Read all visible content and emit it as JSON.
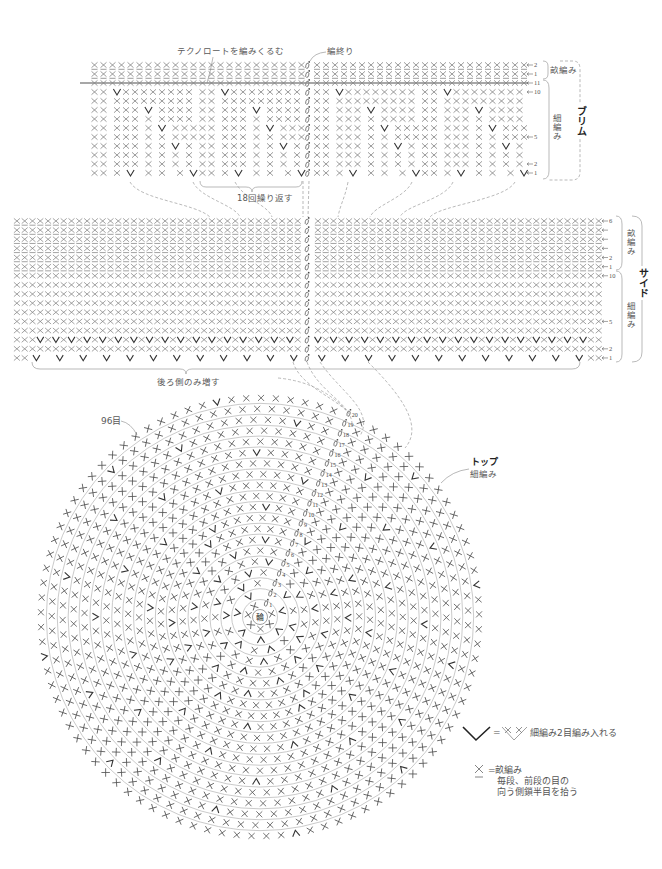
{
  "annotations": {
    "wrap_technoroto": "テクノロートを編みくるむ",
    "finish": "編終り",
    "repeat": "18回繰り返す",
    "increase_back_only": "後ろ側のみ増す",
    "stitch_count": "96目"
  },
  "brim": {
    "title": "ブリム",
    "back_loop_label": "畝編み",
    "single_crochet_label": "細編み",
    "rows": [
      {
        "marker": "2",
        "unit": " u u u u u u u u u u u u"
      },
      {
        "marker": "1",
        "unit": " u u u u u u u u u u u u"
      },
      {
        "marker": "11",
        "unit": " x x x x x x x x x x x x",
        "technoroto": true
      },
      {
        "marker": "10",
        "unit": " x x  v x x x x x x x x "
      },
      {
        "marker": null,
        "unit": " x x  x x x x x x x x x "
      },
      {
        "marker": null,
        "unit": " x x  x x x  v  x x x x "
      },
      {
        "marker": null,
        "unit": " x x  x x x  x  x x x x "
      },
      {
        "marker": null,
        "unit": " x x  x x x  x  v  x x x"
      },
      {
        "marker": "5",
        "unit": " x x  x x x  x  x  x x x"
      },
      {
        "marker": null,
        "unit": " x x  x x x  x  x  v  x "
      },
      {
        "marker": null,
        "unit": " x x  x x x  x  x  x  x "
      },
      {
        "marker": "2",
        "unit": " x x  x x x  x  x  x  x "
      },
      {
        "marker": "1",
        "unit": " x x  x  v   x  x   x  v"
      }
    ]
  },
  "side": {
    "title": "サイド",
    "back_loop_label": "畝編み",
    "single_crochet_label": "細編み",
    "rows": [
      {
        "marker": "6",
        "unit": " u"
      },
      {
        "marker": "",
        "unit": " u"
      },
      {
        "marker": "",
        "unit": " u"
      },
      {
        "marker": "",
        "unit": " u"
      },
      {
        "marker": "2",
        "unit": " u"
      },
      {
        "marker": "1",
        "unit": " u"
      },
      {
        "marker": "10",
        "unit": " x"
      },
      {
        "marker": null,
        "unit": " x"
      },
      {
        "marker": null,
        "unit": " x"
      },
      {
        "marker": null,
        "unit": " x"
      },
      {
        "marker": null,
        "unit": " x"
      },
      {
        "marker": "5",
        "unit": " x"
      },
      {
        "marker": null,
        "unit": " x"
      },
      {
        "marker": null,
        "lead": " x x x",
        "unit": " v x",
        "tail": " x x"
      },
      {
        "marker": "2",
        "unit": " x"
      },
      {
        "marker": "1",
        "lead": " x x",
        "unit": "  v   ",
        "tail": " x x"
      }
    ]
  },
  "top": {
    "title": "トップ",
    "stitch_label": "細編み",
    "center_label": "輪",
    "rounds": [
      {
        "label": "1",
        "stitches": 6
      },
      {
        "label": "2",
        "stitches": 12
      },
      {
        "label": "3",
        "stitches": 18
      },
      {
        "label": "4",
        "stitches": 24
      },
      {
        "label": "5",
        "stitches": 30
      },
      {
        "label": "6",
        "stitches": 36
      },
      {
        "label": "7",
        "stitches": 42
      },
      {
        "label": "8",
        "stitches": 48
      },
      {
        "label": "9",
        "stitches": 52
      },
      {
        "label": "10",
        "stitches": 56
      },
      {
        "label": "11",
        "stitches": 60
      },
      {
        "label": "12",
        "stitches": 64
      },
      {
        "label": "13",
        "stitches": 68
      },
      {
        "label": "14",
        "stitches": 72
      },
      {
        "label": "15",
        "stitches": 76
      },
      {
        "label": "16",
        "stitches": 80
      },
      {
        "label": "17",
        "stitches": 84
      },
      {
        "label": "18",
        "stitches": 88
      },
      {
        "label": "19",
        "stitches": 92
      },
      {
        "label": "20",
        "stitches": 96
      }
    ]
  },
  "legend": {
    "increase": {
      "equals": "=",
      "text": "細編み2目編み入れる"
    },
    "back_loop": {
      "equals": "=",
      "term": "畝編み",
      "note_line1": "毎段、前段の目の",
      "note_line2": "向う側鎖半目を拾う"
    }
  },
  "colors": {
    "stitch": "#7b7b7b",
    "increase": "#333333",
    "ring_stitch": "#555555",
    "guide_line": "#9c9c9c"
  }
}
